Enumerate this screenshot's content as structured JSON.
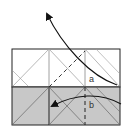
{
  "diagram": {
    "type": "origami-fold-step",
    "colors": {
      "paper_front": "#ffffff",
      "paper_back": "#c8c8c8",
      "line": "#222222",
      "crease": "#777777"
    },
    "labels": {
      "a": "a",
      "b": "b"
    },
    "arrows": [
      {
        "name": "fold-arrow-up",
        "description": "curved valley-fold arrow from lower right up-left"
      },
      {
        "name": "fold-arrow-left",
        "description": "curved arrow across gray section pointing left"
      }
    ],
    "lines": {
      "dashed_diagonal": "valley fold line in upper white section",
      "dashed_vertical": "valley fold line in lower gray section"
    }
  }
}
